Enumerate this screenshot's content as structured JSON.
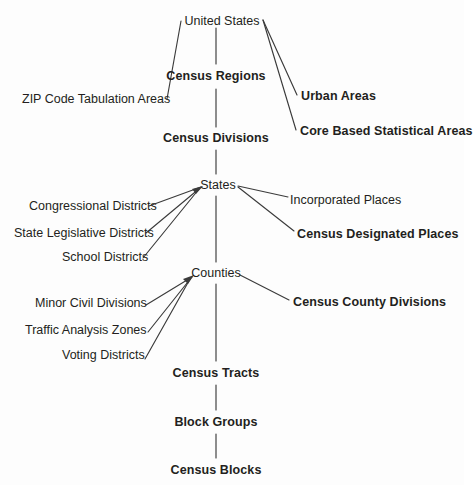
{
  "diagram": {
    "type": "hierarchy-tree",
    "line_color": "#3b3b3b",
    "text_color": "#231f20",
    "background": "#fdfdfd",
    "nodes": [
      {
        "id": "united-states",
        "label": "United States",
        "weight": "regular",
        "x": 222,
        "y": 14,
        "anchor": "center"
      },
      {
        "id": "zip-code-tabulation-areas",
        "label": "ZIP Code Tabulation Areas",
        "weight": "regular",
        "x": 22,
        "y": 92,
        "anchor": "start"
      },
      {
        "id": "census-regions",
        "label": "Census Regions",
        "weight": "bold",
        "x": 216,
        "y": 69,
        "anchor": "center"
      },
      {
        "id": "urban-areas",
        "label": "Urban Areas",
        "weight": "bold",
        "x": 301,
        "y": 89,
        "anchor": "start"
      },
      {
        "id": "core-based-statistical-areas",
        "label": "Core Based Statistical Areas",
        "weight": "bold",
        "x": 300,
        "y": 124,
        "anchor": "start"
      },
      {
        "id": "census-divisions",
        "label": "Census Divisions",
        "weight": "bold",
        "x": 216,
        "y": 131,
        "anchor": "center"
      },
      {
        "id": "states",
        "label": "States",
        "weight": "regular",
        "x": 218,
        "y": 178,
        "anchor": "center"
      },
      {
        "id": "congressional-districts",
        "label": "Congressional Districts",
        "weight": "regular",
        "x": 29,
        "y": 199,
        "anchor": "start"
      },
      {
        "id": "state-legislative-districts",
        "label": "State Legislative Districts",
        "weight": "regular",
        "x": 14,
        "y": 226,
        "anchor": "start"
      },
      {
        "id": "school-districts",
        "label": "School Districts",
        "weight": "regular",
        "x": 62,
        "y": 250,
        "anchor": "start"
      },
      {
        "id": "incorporated-places",
        "label": "Incorporated Places",
        "weight": "regular",
        "x": 290,
        "y": 193,
        "anchor": "start"
      },
      {
        "id": "census-designated-places",
        "label": "Census Designated Places",
        "weight": "bold",
        "x": 297,
        "y": 227,
        "anchor": "start"
      },
      {
        "id": "counties",
        "label": "Counties",
        "weight": "regular",
        "x": 216,
        "y": 266,
        "anchor": "center"
      },
      {
        "id": "minor-civil-divisions",
        "label": "Minor Civil Divisions",
        "weight": "regular",
        "x": 35,
        "y": 296,
        "anchor": "start"
      },
      {
        "id": "traffic-analysis-zones",
        "label": "Traffic Analysis Zones",
        "weight": "regular",
        "x": 25,
        "y": 323,
        "anchor": "start"
      },
      {
        "id": "voting-districts",
        "label": "Voting Districts",
        "weight": "regular",
        "x": 62,
        "y": 348,
        "anchor": "start"
      },
      {
        "id": "census-county-divisions",
        "label": "Census County Divisions",
        "weight": "bold",
        "x": 293,
        "y": 295,
        "anchor": "start"
      },
      {
        "id": "census-tracts",
        "label": "Census Tracts",
        "weight": "bold",
        "x": 216,
        "y": 366,
        "anchor": "center"
      },
      {
        "id": "block-groups",
        "label": "Block Groups",
        "weight": "bold",
        "x": 216,
        "y": 415,
        "anchor": "center"
      },
      {
        "id": "census-blocks",
        "label": "Census Blocks",
        "weight": "bold",
        "x": 216,
        "y": 463,
        "anchor": "center"
      }
    ],
    "edges": [
      {
        "from": "united-states",
        "to": "zip-code-tabulation-areas",
        "kind": "diagonal"
      },
      {
        "from": "united-states",
        "to": "census-regions",
        "kind": "spine"
      },
      {
        "from": "united-states",
        "to": "urban-areas",
        "kind": "diagonal"
      },
      {
        "from": "united-states",
        "to": "core-based-statistical-areas",
        "kind": "diagonal"
      },
      {
        "from": "census-regions",
        "to": "census-divisions",
        "kind": "spine"
      },
      {
        "from": "census-divisions",
        "to": "states",
        "kind": "spine"
      },
      {
        "from": "congressional-districts",
        "to": "states",
        "kind": "diagonal-arrow"
      },
      {
        "from": "state-legislative-districts",
        "to": "states",
        "kind": "diagonal-arrow"
      },
      {
        "from": "school-districts",
        "to": "states",
        "kind": "diagonal-arrow"
      },
      {
        "from": "states",
        "to": "incorporated-places",
        "kind": "diagonal"
      },
      {
        "from": "states",
        "to": "census-designated-places",
        "kind": "diagonal"
      },
      {
        "from": "states",
        "to": "counties",
        "kind": "spine"
      },
      {
        "from": "minor-civil-divisions",
        "to": "counties",
        "kind": "diagonal-arrow"
      },
      {
        "from": "traffic-analysis-zones",
        "to": "counties",
        "kind": "diagonal-arrow"
      },
      {
        "from": "voting-districts",
        "to": "counties",
        "kind": "diagonal-arrow"
      },
      {
        "from": "counties",
        "to": "census-county-divisions",
        "kind": "diagonal"
      },
      {
        "from": "counties",
        "to": "census-tracts",
        "kind": "spine"
      },
      {
        "from": "census-tracts",
        "to": "block-groups",
        "kind": "spine"
      },
      {
        "from": "block-groups",
        "to": "census-blocks",
        "kind": "spine"
      }
    ]
  }
}
